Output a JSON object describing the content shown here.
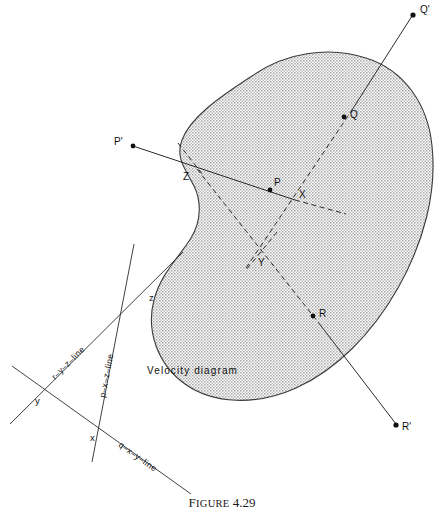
{
  "figure": {
    "caption_word": "Figure",
    "caption_number": "4.29",
    "caption_full": "FIGURE 4.29"
  },
  "body_region": {
    "name": "shaded-body",
    "fill_color": "#c9c9c9",
    "stroke_color": "#3a3a3a",
    "description": "kidney shaped stippled region"
  },
  "space_diagram": {
    "interior_points": [
      {
        "label": "P",
        "x": 270,
        "y": 190,
        "label_dx": 3,
        "label_dy": -4
      },
      {
        "label": "Q",
        "x": 344,
        "y": 117,
        "label_dx": 5,
        "label_dy": 1
      },
      {
        "label": "R",
        "x": 313,
        "y": 316,
        "label_dx": 5,
        "label_dy": 1
      }
    ],
    "exterior_points": [
      {
        "label": "P'",
        "x": 131,
        "y": 146,
        "label_dx": -14,
        "label_dy": -1
      },
      {
        "label": "Q'",
        "x": 414,
        "y": 14,
        "label_dx": 5,
        "label_dy": -2
      },
      {
        "label": "R'",
        "x": 398,
        "y": 427,
        "label_dx": 5,
        "label_dy": 3
      }
    ],
    "intersection_points": [
      {
        "label": "X",
        "x": 295,
        "y": 200,
        "label_dx": 4,
        "label_dy": -2
      },
      {
        "label": "Y",
        "x": 261,
        "y": 253,
        "label_dx": 2,
        "label_dy": 11
      },
      {
        "label": "Z",
        "x": 197,
        "y": 168,
        "label_dx": -11,
        "label_dy": 10
      }
    ]
  },
  "velocity_diagram": {
    "title": "Velocity  diagram",
    "title_x": 147,
    "title_y": 374,
    "points": [
      {
        "label": "x",
        "x": 97,
        "y": 435,
        "label_dx": -7,
        "label_dy": -1
      },
      {
        "label": "y",
        "x": 37,
        "y": 393,
        "label_dx": -2,
        "label_dy": 11
      },
      {
        "label": "z",
        "x": 144,
        "y": 297,
        "label_dx": 5,
        "label_dy": 4
      }
    ],
    "lines": [
      {
        "label": "r–y–z–line",
        "x1": 10,
        "y1": 424,
        "x2": 183,
        "y2": 252,
        "label_t": 0.42,
        "label_offset": -7
      },
      {
        "label": "p–x–z–line",
        "x1": 92,
        "y1": 462,
        "x2": 134,
        "y2": 244,
        "label_t": 0.47,
        "label_offset": -8
      },
      {
        "label": "q–x–y–line",
        "x1": 12,
        "y1": 366,
        "x2": 191,
        "y2": 494,
        "label_t": 0.66,
        "label_offset": -8
      }
    ]
  },
  "rays": [
    {
      "name": "p-ray",
      "from": "P'",
      "to": "P",
      "style": "solid"
    },
    {
      "name": "q-ray",
      "from": "Q",
      "to": "Q'",
      "style": "solid"
    },
    {
      "name": "r-ray",
      "from": "R",
      "to": "R'",
      "style": "solid"
    },
    {
      "name": "p-chord-dashed",
      "from": "X",
      "style": "dashed"
    },
    {
      "name": "q-chord-dashed",
      "from": "Q",
      "to": "Y",
      "style": "dashed"
    },
    {
      "name": "r-chord-dashed",
      "from": "R",
      "to": "Y",
      "style": "dashed"
    },
    {
      "name": "z-tick-dashed",
      "from": "Z",
      "style": "dashed"
    }
  ]
}
